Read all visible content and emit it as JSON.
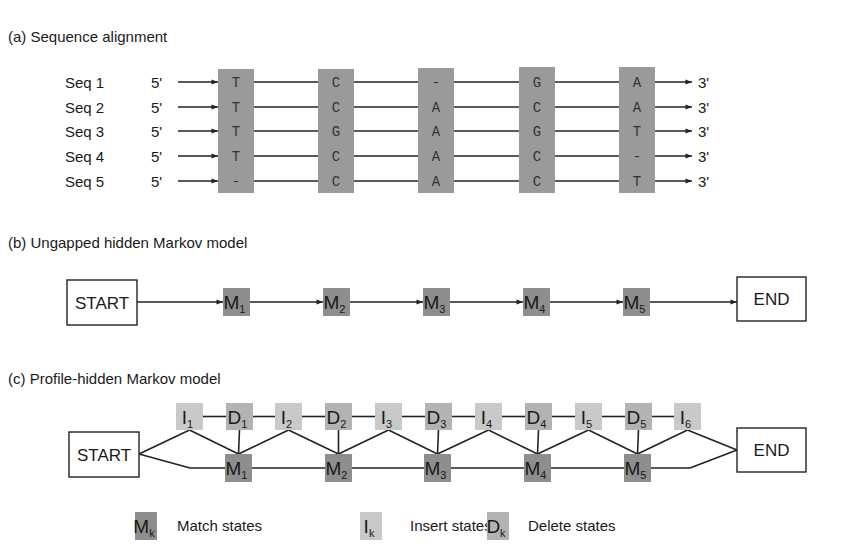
{
  "colors": {
    "alignment_column": "#9a9a9a",
    "match_state": "#8e8e8e",
    "delete_state": "#b3b3b3",
    "insert_state": "#c9c9c9",
    "line": "#222222",
    "text": "#1a1a1a"
  },
  "panel_a": {
    "title": "(a) Sequence alignment",
    "five_prime": "5'",
    "three_prime": "3'",
    "sequences": [
      {
        "label": "Seq 1",
        "residues": [
          "T",
          "C",
          "-",
          "G",
          "A"
        ]
      },
      {
        "label": "Seq 2",
        "residues": [
          "T",
          "C",
          "A",
          "C",
          "A"
        ]
      },
      {
        "label": "Seq 3",
        "residues": [
          "T",
          "G",
          "A",
          "G",
          "T"
        ]
      },
      {
        "label": "Seq 4",
        "residues": [
          "T",
          "C",
          "A",
          "C",
          "-"
        ]
      },
      {
        "label": "Seq 5",
        "residues": [
          "-",
          "C",
          "A",
          "C",
          "T"
        ]
      }
    ]
  },
  "panel_b": {
    "title": "(b) Ungapped hidden Markov model",
    "start_label": "START",
    "end_label": "END",
    "states": [
      {
        "letter": "M",
        "index": "1"
      },
      {
        "letter": "M",
        "index": "2"
      },
      {
        "letter": "M",
        "index": "3"
      },
      {
        "letter": "M",
        "index": "4"
      },
      {
        "letter": "M",
        "index": "5"
      }
    ]
  },
  "panel_c": {
    "title": "(c) Profile-hidden Markov model",
    "start_label": "START",
    "end_label": "END",
    "top_row": [
      {
        "letter": "I",
        "index": "1",
        "type": "insert"
      },
      {
        "letter": "D",
        "index": "1",
        "type": "delete"
      },
      {
        "letter": "I",
        "index": "2",
        "type": "insert"
      },
      {
        "letter": "D",
        "index": "2",
        "type": "delete"
      },
      {
        "letter": "I",
        "index": "3",
        "type": "insert"
      },
      {
        "letter": "D",
        "index": "3",
        "type": "delete"
      },
      {
        "letter": "I",
        "index": "4",
        "type": "insert"
      },
      {
        "letter": "D",
        "index": "4",
        "type": "delete"
      },
      {
        "letter": "I",
        "index": "5",
        "type": "insert"
      },
      {
        "letter": "D",
        "index": "5",
        "type": "delete"
      },
      {
        "letter": "I",
        "index": "6",
        "type": "insert"
      }
    ],
    "match_row": [
      {
        "letter": "M",
        "index": "1"
      },
      {
        "letter": "M",
        "index": "2"
      },
      {
        "letter": "M",
        "index": "3"
      },
      {
        "letter": "M",
        "index": "4"
      },
      {
        "letter": "M",
        "index": "5"
      }
    ]
  },
  "legend": [
    {
      "letter": "M",
      "index": "k",
      "type": "match",
      "label": "Match states"
    },
    {
      "letter": "I",
      "index": "k",
      "type": "insert",
      "label": "Insert states"
    },
    {
      "letter": "D",
      "index": "k",
      "type": "delete",
      "label": "Delete states"
    }
  ]
}
